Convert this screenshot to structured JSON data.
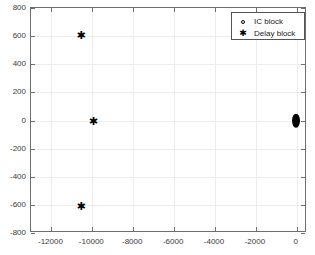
{
  "chart_data": {
    "type": "scatter",
    "title": "",
    "xlabel": "",
    "ylabel": "",
    "xlim": [
      -13000,
      500
    ],
    "ylim": [
      -800,
      800
    ],
    "grid": true,
    "legend_position": "top-right",
    "xticks": [
      -12000,
      -10000,
      -8000,
      -6000,
      -4000,
      -2000,
      0
    ],
    "xticklabels": [
      "-12000",
      "-10000",
      "-8000",
      "-6000",
      "-4000",
      "-2000",
      "0"
    ],
    "yticks": [
      -800,
      -600,
      -400,
      -200,
      0,
      200,
      400,
      600,
      800
    ],
    "yticklabels": [
      "-800",
      "-600",
      "-400",
      "-200",
      "0",
      "200",
      "400",
      "600",
      "800"
    ],
    "series": [
      {
        "name": "IC block",
        "marker": "circle-open",
        "color": "#000000",
        "points": []
      },
      {
        "name": "Delay block",
        "marker": "asterisk",
        "color": "#000000",
        "points": [
          {
            "x": -10600,
            "y": 605
          },
          {
            "x": -10000,
            "y": 0
          },
          {
            "x": -10600,
            "y": -605
          }
        ],
        "cluster": {
          "note": "dense overlapping markers at origin",
          "x": -60,
          "y_min": -30,
          "y_max": 30
        }
      }
    ]
  },
  "legend": {
    "entries": [
      {
        "label": "IC block",
        "marker_glyph": "○",
        "marker_name": "circle-open-marker"
      },
      {
        "label": "Delay block",
        "marker_glyph": "✱",
        "marker_name": "asterisk-marker"
      }
    ]
  },
  "colors": {
    "background": "#ffffff",
    "axis": "#6e6e6e",
    "grid": "#ededed",
    "marker": "#000000",
    "text": "#3a3a3a"
  }
}
